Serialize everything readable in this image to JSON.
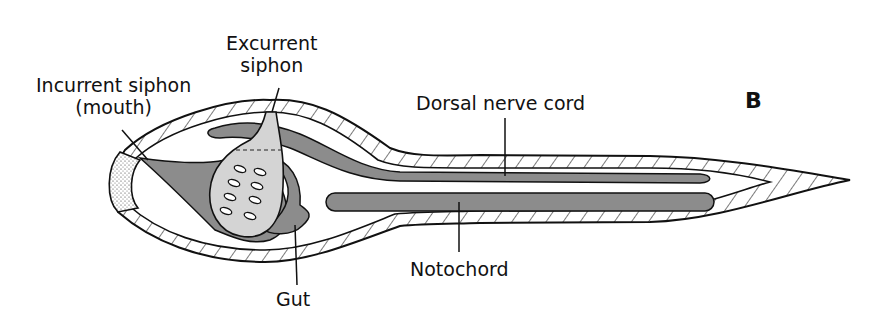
{
  "figure": {
    "panel_letter": "B",
    "colors": {
      "fill_gray": "#8c8c8c",
      "light_gray": "#d4d4d4",
      "outline": "#111111",
      "background": "#ffffff"
    }
  },
  "labels": {
    "incurrent_line1": "Incurrent siphon",
    "incurrent_line2": "(mouth)",
    "excurrent_line1": "Excurrent",
    "excurrent_line2": "siphon",
    "dorsal_nerve_cord": "Dorsal nerve cord",
    "notochord": "Notochord",
    "gut": "Gut"
  }
}
